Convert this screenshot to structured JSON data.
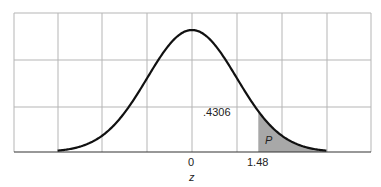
{
  "chart_data": {
    "type": "area",
    "title": "",
    "xlabel": "z",
    "ylabel": "",
    "distribution": "standard normal",
    "x_range": [
      -3,
      3
    ],
    "grid": true,
    "tick_labels": [
      {
        "z": 0,
        "label": "0"
      },
      {
        "z": 1.48,
        "label": "1.48"
      }
    ],
    "shaded_region": {
      "from": 1.48,
      "to": 3,
      "label": "P",
      "color": "#a8a8a8"
    },
    "annotations": [
      {
        "text": ".4306",
        "meaning": "area between 0 and 1.48"
      }
    ],
    "colors": {
      "curve": "#111111",
      "grid": "#b5b5b5",
      "shade": "#a8a8a8"
    }
  },
  "labels": {
    "tick0": "0",
    "tick148": "1.48",
    "xlabel": "z",
    "area_value": ".4306",
    "shade_label": "P"
  }
}
